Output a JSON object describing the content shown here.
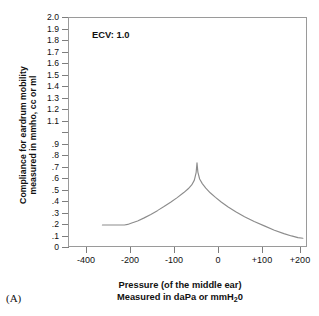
{
  "figure": {
    "panel_label": "(A)",
    "annotation": "ECV: 1.0"
  },
  "axes": {
    "y_title_line1": "Compliance for eardrum mobility",
    "y_title_line2": "measured in mmho, cc or ml",
    "x_title_line1": "Pressure (of the middle ear)",
    "x_title_line2_before": "Measured in daPa or mmH",
    "x_title_line2_sub": "2",
    "x_title_line2_after": "0"
  },
  "chart_data": {
    "type": "line",
    "title": "",
    "subtitle": "",
    "xlabel": "Pressure (of the middle ear) Measured in daPa or mmH20",
    "ylabel": "Compliance for eardrum mobility measured in mmho, cc or ml",
    "annotations": [
      "ECV: 1.0",
      "(A)"
    ],
    "grid": false,
    "legend": "none",
    "xlim": [
      -450,
      230
    ],
    "ylim": [
      0,
      2.0
    ],
    "x_tick_labels": [
      "-400",
      "-200",
      "-100",
      "0",
      "+100",
      "+200"
    ],
    "x_tick_values": [
      -400,
      -200,
      -100,
      0,
      100,
      200
    ],
    "x_tick_note": "tick marks are evenly spaced on the page; the -400 to -200 interval is compressed relative to the others",
    "y_tick_labels": [
      "2.0",
      "1.9",
      "1.8",
      "1.7",
      "1.6",
      "1.5",
      "1.4",
      "1.3",
      "1.2",
      "1.1",
      "",
      ".9",
      ".8",
      ".7",
      ".6",
      ".5",
      ".4",
      ".3",
      ".2",
      ".1",
      "0"
    ],
    "y_tick_values": [
      2.0,
      1.9,
      1.8,
      1.7,
      1.6,
      1.5,
      1.4,
      1.3,
      1.2,
      1.1,
      1.0,
      0.9,
      0.8,
      0.7,
      0.6,
      0.5,
      0.4,
      0.3,
      0.2,
      0.1,
      0.0
    ],
    "series": [
      {
        "name": "tympanogram",
        "color": "#8c8c8c",
        "peak_pressure": -50,
        "peak_compliance": 0.74,
        "x": [
          -330,
          -300,
          -270,
          -250,
          -230,
          -215,
          -200,
          -185,
          -170,
          -155,
          -140,
          -125,
          -110,
          -95,
          -80,
          -70,
          -62,
          -56,
          -52,
          -50,
          -48,
          -44,
          -38,
          -30,
          -20,
          -8,
          5,
          20,
          38,
          58,
          80,
          105,
          130,
          155,
          175,
          192,
          205
        ],
        "y": [
          0.2,
          0.2,
          0.2,
          0.2,
          0.2,
          0.205,
          0.215,
          0.235,
          0.262,
          0.292,
          0.325,
          0.36,
          0.398,
          0.438,
          0.482,
          0.515,
          0.548,
          0.59,
          0.655,
          0.74,
          0.66,
          0.6,
          0.56,
          0.52,
          0.48,
          0.44,
          0.4,
          0.358,
          0.315,
          0.272,
          0.23,
          0.19,
          0.155,
          0.125,
          0.105,
          0.09,
          0.085
        ]
      }
    ]
  }
}
